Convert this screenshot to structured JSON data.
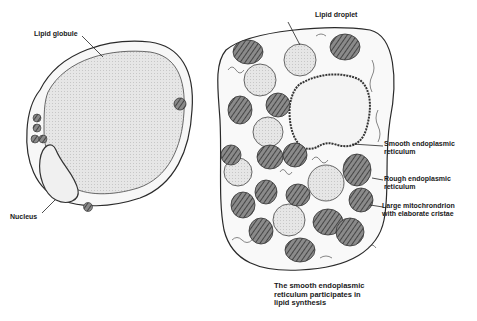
{
  "figure": {
    "left_cell": {
      "name": "White adipose cell",
      "labels": {
        "lipid_globule": "Lipid globule",
        "nucleus": "Nucleus"
      }
    },
    "right_cell": {
      "name": "Steroid-secreting cell",
      "labels": {
        "lipid_droplet": "Lipid droplet",
        "smooth_er_line1": "Smooth endoplasmic",
        "smooth_er_line2": "reticulum",
        "rough_er_line1": "Rough endoplasmic",
        "rough_er_line2": "reticulum",
        "mito_line1": "Large mitochrondrion",
        "mito_line2": "with elaborate cristae"
      }
    },
    "caption": {
      "line1": "The smooth endoplasmic",
      "line2": "reticulum participates in",
      "line3": "lipid synthesis"
    },
    "colors": {
      "ink": "#2a2a2a",
      "lipid_fill": "#e4e4e4",
      "mito_fill": "#6a6a6a",
      "nucleus_fill": "#efefef",
      "background": "#ffffff"
    }
  }
}
